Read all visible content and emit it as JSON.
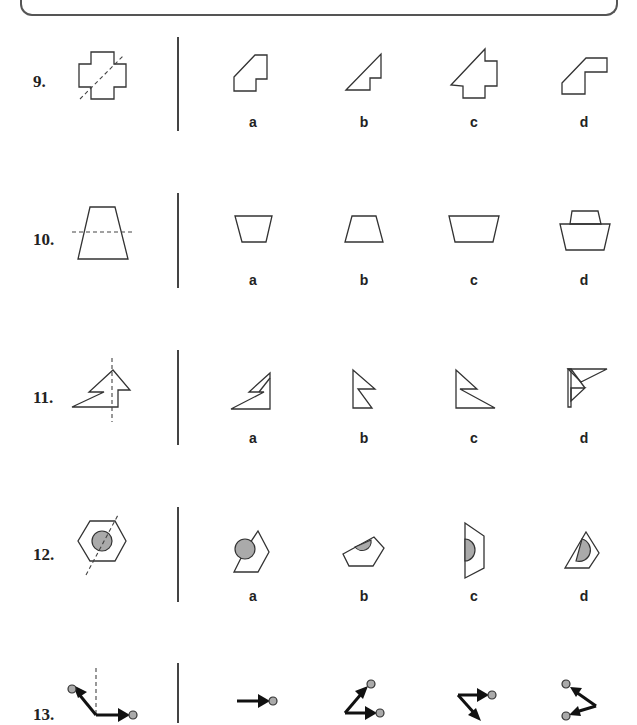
{
  "questions": [
    {
      "number": "9.",
      "options": [
        "a",
        "b",
        "c",
        "d"
      ]
    },
    {
      "number": "10.",
      "options": [
        "a",
        "b",
        "c",
        "d"
      ]
    },
    {
      "number": "11.",
      "options": [
        "a",
        "b",
        "c",
        "d"
      ]
    },
    {
      "number": "12.",
      "options": [
        "a",
        "b",
        "c",
        "d"
      ]
    },
    {
      "number": "13.",
      "options": []
    }
  ],
  "colors": {
    "stroke": "#333333",
    "fill_grey": "#aaaaaa",
    "background": "#ffffff"
  }
}
